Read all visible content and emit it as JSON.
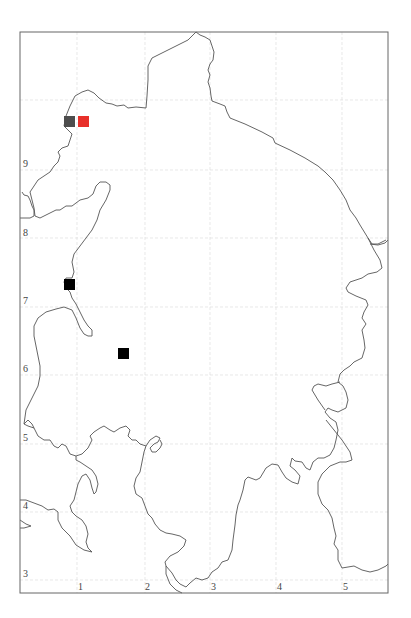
{
  "map": {
    "type": "distribution-map",
    "frame": {
      "left": 20,
      "top": 32,
      "right": 388,
      "bottom": 593
    },
    "x_axis": {
      "ticks": [
        {
          "label": "1",
          "x": 80
        },
        {
          "label": "2",
          "x": 148
        },
        {
          "label": "3",
          "x": 214
        },
        {
          "label": "4",
          "x": 279
        },
        {
          "label": "5",
          "x": 346
        }
      ],
      "label_y": 589
    },
    "y_axis": {
      "ticks": [
        {
          "label": "9",
          "y": 163
        },
        {
          "label": "8",
          "y": 232
        },
        {
          "label": "7",
          "y": 300
        },
        {
          "label": "6",
          "y": 368
        },
        {
          "label": "5",
          "y": 437
        },
        {
          "label": "4",
          "y": 505
        },
        {
          "label": "3",
          "y": 573
        }
      ],
      "label_x": 25
    },
    "markers": [
      {
        "name": "record-gray",
        "x": 64,
        "y": 116,
        "size": 11,
        "color": "#4d4d4d"
      },
      {
        "name": "record-red",
        "x": 78,
        "y": 116,
        "size": 11,
        "color": "#e8302a"
      },
      {
        "name": "record-black-1",
        "x": 64,
        "y": 279,
        "size": 11,
        "color": "#000000"
      },
      {
        "name": "record-black-2",
        "x": 118,
        "y": 348,
        "size": 11,
        "color": "#000000"
      }
    ],
    "colors": {
      "coastline": "#555555",
      "frame": "#666666",
      "grid": "#d9d9d9",
      "tick_text": "#444444"
    }
  }
}
